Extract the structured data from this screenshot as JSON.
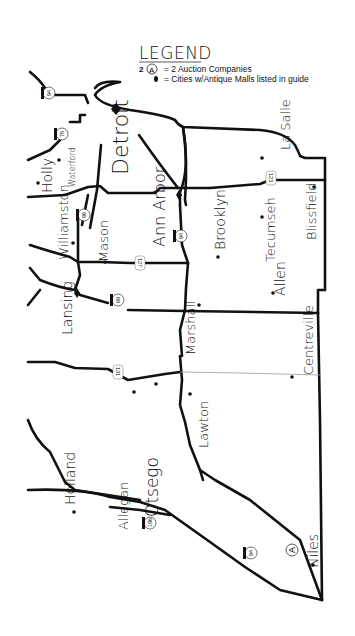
{
  "legend": {
    "title": "LEGEND",
    "auction": {
      "count": "2",
      "symbol": "A",
      "text": "= 2 Auction Companies"
    },
    "city": {
      "text": "= Cities w/Antique Malls listed in guide"
    }
  },
  "cities": [
    {
      "name": "Detroit",
      "size": "large",
      "marker": "diamond"
    },
    {
      "name": "Holly",
      "marker": "dot"
    },
    {
      "name": "Waterford",
      "marker": "dot"
    },
    {
      "name": "La Salle",
      "marker": "dot"
    },
    {
      "name": "Williamston",
      "marker": "dot"
    },
    {
      "name": "Mason",
      "marker": "dot"
    },
    {
      "name": "Ann Arbor",
      "marker": "diamond"
    },
    {
      "name": "Brooklyn",
      "marker": "dot"
    },
    {
      "name": "Tecumseh",
      "marker": "dot"
    },
    {
      "name": "Blissfield",
      "marker": "dot"
    },
    {
      "name": "Lansing",
      "marker": "diamond"
    },
    {
      "name": "Allen",
      "marker": "dot"
    },
    {
      "name": "Marshall",
      "marker": "dot"
    },
    {
      "name": "Centreville",
      "marker": "dot"
    },
    {
      "name": "Holland",
      "marker": "dot"
    },
    {
      "name": "Allegan",
      "marker": "dot"
    },
    {
      "name": "Otsego",
      "marker": "dot"
    },
    {
      "name": "Lawton",
      "marker": "dot"
    },
    {
      "name": "Niles",
      "marker": "dot",
      "auction": "A"
    }
  ],
  "highways": [
    {
      "number": "94",
      "type": "interstate"
    },
    {
      "number": "75",
      "type": "interstate"
    },
    {
      "number": "96",
      "type": "interstate"
    },
    {
      "number": "94",
      "type": "interstate"
    },
    {
      "number": "127",
      "type": "us"
    },
    {
      "number": "69",
      "type": "interstate"
    },
    {
      "number": "12",
      "type": "us"
    },
    {
      "number": "131",
      "type": "us"
    },
    {
      "number": "196",
      "type": "interstate"
    },
    {
      "number": "94",
      "type": "interstate"
    }
  ],
  "colors": {
    "ink": "#111111",
    "paper": "#ffffff",
    "county_line": "#9a9a9a"
  }
}
